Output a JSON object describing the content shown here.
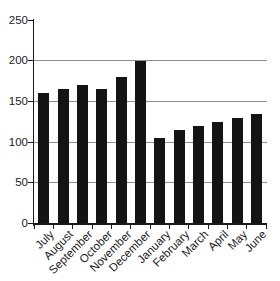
{
  "chart_data": {
    "type": "bar",
    "title": "",
    "xlabel": "",
    "ylabel": "",
    "categories": [
      "July",
      "August",
      "September",
      "October",
      "November",
      "December",
      "January",
      "February",
      "March",
      "April",
      "May",
      "June"
    ],
    "values": [
      160,
      165,
      170,
      165,
      180,
      200,
      105,
      115,
      120,
      125,
      130,
      135
    ],
    "ylim": [
      0,
      250
    ],
    "yticks": [
      0,
      50,
      100,
      150,
      200,
      250
    ],
    "gridlines": [
      50,
      100,
      150,
      200
    ],
    "grid": "horizontal",
    "legend": "none",
    "bar_color": "#141414",
    "gridline_color": "#8f8f8f",
    "axis_color": "#1a1a1a",
    "text_color": "#1a1a1a",
    "background_color": "#ffffff"
  }
}
